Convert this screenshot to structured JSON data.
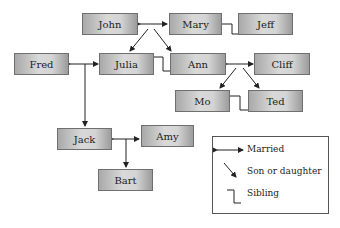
{
  "diagram": {
    "type": "family-tree",
    "nodes": {
      "john": "John",
      "mary": "Mary",
      "jeff": "Jeff",
      "fred": "Fred",
      "julia": "Julia",
      "ann": "Ann",
      "cliff": "Cliff",
      "mo": "Mo",
      "ted": "Ted",
      "jack": "Jack",
      "amy": "Amy",
      "bart": "Bart"
    },
    "relations": [
      {
        "type": "married",
        "a": "John",
        "b": "Mary"
      },
      {
        "type": "son-or-daughter",
        "parents": "John+Mary",
        "child": "Julia"
      },
      {
        "type": "son-or-daughter",
        "parents": "John+Mary",
        "child": "Ann"
      },
      {
        "type": "sibling",
        "a": "Mary",
        "b": "Jeff"
      },
      {
        "type": "sibling",
        "a": "Julia",
        "b": "Ann"
      },
      {
        "type": "married",
        "a": "Fred",
        "b": "Julia"
      },
      {
        "type": "married",
        "a": "Ann",
        "b": "Cliff"
      },
      {
        "type": "son-or-daughter",
        "parents": "Ann+Cliff",
        "child": "Mo"
      },
      {
        "type": "son-or-daughter",
        "parents": "Ann+Cliff",
        "child": "Ted"
      },
      {
        "type": "sibling",
        "a": "Mo",
        "b": "Ted"
      },
      {
        "type": "son-or-daughter",
        "parents": "Fred+Julia",
        "child": "Jack"
      },
      {
        "type": "married",
        "a": "Jack",
        "b": "Amy"
      },
      {
        "type": "son-or-daughter",
        "parents": "Jack+Amy",
        "child": "Bart"
      }
    ]
  },
  "legend": {
    "married": "Married",
    "child": "Son or daughter",
    "sibling": "Sibling"
  }
}
